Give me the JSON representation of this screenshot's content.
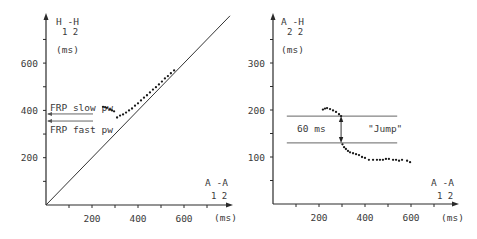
{
  "chart_data": [
    {
      "type": "scatter",
      "title": "",
      "ylabel": "H1-H2 (ms)",
      "ylabel_main": "H -H",
      "ylabel_sub": "1  2",
      "ylabel_unit": "(ms)",
      "xlabel": "A1-A2 (ms)",
      "xlabel_main": "A -A",
      "xlabel_sub": "1  2",
      "xlabel_unit": "(ms)",
      "xlim": [
        0,
        800
      ],
      "ylim": [
        0,
        800
      ],
      "x_ticks": [
        100,
        200,
        300,
        400,
        500,
        600,
        700
      ],
      "x_tick_labels": [
        {
          "value": 200,
          "label": "200"
        },
        {
          "value": 400,
          "label": "400"
        },
        {
          "value": 600,
          "label": "600"
        }
      ],
      "y_ticks": [
        100,
        200,
        300,
        400,
        500,
        600,
        700
      ],
      "y_tick_labels": [
        {
          "value": 200,
          "label": "200"
        },
        {
          "value": 400,
          "label": "400"
        },
        {
          "value": 600,
          "label": "600"
        }
      ],
      "grid": false,
      "reference_line": {
        "type": "identity",
        "from": [
          0,
          0
        ],
        "to": [
          800,
          800
        ]
      },
      "annotations": [
        {
          "text": "FRP slow pw",
          "y_value": 385,
          "arrow_to_axis": true
        },
        {
          "text": "FRP fast pw",
          "y_value": 355,
          "arrow_to_axis": true
        }
      ],
      "series": [
        {
          "name": "H1-H2 vs A1-A2",
          "points": [
            [
              248,
              415
            ],
            [
              257,
              413
            ],
            [
              265,
              411
            ],
            [
              278,
              404
            ],
            [
              287,
              400
            ],
            [
              296,
              396
            ],
            [
              309,
              370
            ],
            [
              322,
              378
            ],
            [
              335,
              383
            ],
            [
              348,
              391
            ],
            [
              361,
              400
            ],
            [
              374,
              408
            ],
            [
              387,
              420
            ],
            [
              400,
              430
            ],
            [
              413,
              442
            ],
            [
              426,
              454
            ],
            [
              439,
              464
            ],
            [
              452,
              476
            ],
            [
              465,
              488
            ],
            [
              478,
              498
            ],
            [
              491,
              510
            ],
            [
              504,
              522
            ],
            [
              517,
              535
            ],
            [
              530,
              545
            ],
            [
              543,
              557
            ],
            [
              557,
              569
            ]
          ]
        }
      ]
    },
    {
      "type": "scatter",
      "title": "",
      "ylabel": "A2-H2 (ms)",
      "ylabel_main": "A -H",
      "ylabel_sub": "2  2",
      "ylabel_unit": "(ms)",
      "xlabel": "A1-A2 (ms)",
      "xlabel_main": "A -A",
      "xlabel_sub": "1  2",
      "xlabel_unit": "(ms)",
      "xlim": [
        0,
        800
      ],
      "ylim": [
        0,
        400
      ],
      "x_ticks": [
        100,
        200,
        300,
        400,
        500,
        600,
        700
      ],
      "x_tick_labels": [
        {
          "value": 200,
          "label": "200"
        },
        {
          "value": 400,
          "label": "400"
        },
        {
          "value": 600,
          "label": "600"
        }
      ],
      "y_ticks": [
        50,
        100,
        150,
        200,
        250,
        300,
        350
      ],
      "y_tick_labels": [
        {
          "value": 100,
          "label": "100"
        },
        {
          "value": 200,
          "label": "200"
        },
        {
          "value": 300,
          "label": "300"
        }
      ],
      "grid": false,
      "jump": {
        "upper_y": 187,
        "lower_y": 130,
        "x_from": 60,
        "x_to": 540,
        "arrow_x": 296,
        "difference_label": "60 ms",
        "label": "\"Jump\""
      },
      "series": [
        {
          "name": "A2-H2 vs A1-A2",
          "points": [
            [
              217,
              201
            ],
            [
              226,
              203
            ],
            [
              235,
              204
            ],
            [
              248,
              202
            ],
            [
              261,
              199
            ],
            [
              274,
              196
            ],
            [
              287,
              191
            ],
            [
              296,
              187
            ],
            [
              302,
              127
            ],
            [
              309,
              121
            ],
            [
              317,
              117
            ],
            [
              326,
              113
            ],
            [
              335,
              110
            ],
            [
              348,
              108
            ],
            [
              361,
              106
            ],
            [
              374,
              104
            ],
            [
              387,
              100
            ],
            [
              400,
              98
            ],
            [
              417,
              94
            ],
            [
              435,
              94
            ],
            [
              452,
              94
            ],
            [
              465,
              94
            ],
            [
              478,
              94
            ],
            [
              491,
              96
            ],
            [
              504,
              96
            ],
            [
              522,
              94
            ],
            [
              535,
              94
            ],
            [
              548,
              92
            ],
            [
              561,
              94
            ],
            [
              583,
              92
            ],
            [
              596,
              89
            ]
          ]
        }
      ]
    }
  ]
}
